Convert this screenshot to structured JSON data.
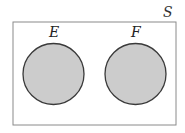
{
  "diagram": {
    "type": "venn",
    "universe": {
      "label": "S",
      "border_color": "#8a8a8a"
    },
    "sets": [
      {
        "label": "E",
        "fill": "#cccccc",
        "stroke": "#3a3a3a"
      },
      {
        "label": "F",
        "fill": "#cccccc",
        "stroke": "#3a3a3a"
      }
    ],
    "relationship": "disjoint (mutually exclusive)"
  }
}
